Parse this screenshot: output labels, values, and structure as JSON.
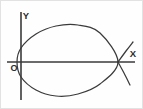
{
  "figure": {
    "background_color": "#fefefe",
    "ink_color": "#3a3a3a",
    "frame_color": "#e2e2e2",
    "width": 143,
    "height": 109
  },
  "labels": {
    "y_axis": "Y",
    "x_axis": "X",
    "origin": "O"
  },
  "chart_data": {
    "type": "line",
    "title": "",
    "xlabel": "X",
    "ylabel": "Y",
    "grid": false,
    "legend": "none",
    "axes": {
      "x_axis_pixel_y": 62,
      "x_axis_pixel_x_start": 7,
      "x_axis_pixel_x_end": 135,
      "y_axis_pixel_x": 21,
      "y_axis_pixel_y_start": 12,
      "y_axis_pixel_y_end": 100,
      "origin_pixel": [
        21,
        62
      ]
    },
    "annotations": [
      {
        "text": "Y",
        "pixel": [
          26,
          16
        ],
        "meaning": "y-axis-label"
      },
      {
        "text": "X",
        "pixel": [
          133,
          54
        ],
        "meaning": "x-axis-label"
      },
      {
        "text": "O",
        "pixel": [
          14,
          68
        ],
        "meaning": "origin-label"
      }
    ],
    "series": [
      {
        "name": "loop",
        "description": "Closed teardrop loop starting and ending at the node on the X axis, bulging left past the Y axis",
        "points": [
          [
            118,
            62
          ],
          [
            100,
            33
          ],
          [
            78,
            25
          ],
          [
            56,
            26
          ],
          [
            36,
            34
          ],
          [
            21,
            48
          ],
          [
            17,
            62
          ],
          [
            21,
            77
          ],
          [
            36,
            90
          ],
          [
            56,
            96
          ],
          [
            78,
            94
          ],
          [
            100,
            84
          ],
          [
            118,
            62
          ]
        ]
      },
      {
        "name": "upper-right-branch",
        "description": "Branch leaving the node toward upper right",
        "points": [
          [
            118,
            62
          ],
          [
            126,
            51
          ],
          [
            133,
            42
          ]
        ]
      },
      {
        "name": "lower-right-branch",
        "description": "Branch leaving the node toward lower right",
        "points": [
          [
            118,
            62
          ],
          [
            124,
            73
          ],
          [
            130,
            85
          ]
        ]
      }
    ],
    "node_point": {
      "label": "self-intersection node",
      "pixel": [
        118,
        62
      ],
      "on_axis": "x"
    }
  }
}
